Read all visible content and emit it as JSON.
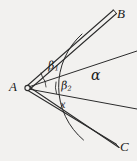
{
  "figure": {
    "kind": "geometry-angle-diagram",
    "background_color": "#f2f1ef",
    "ink_color": "#2b2b2b",
    "points": {
      "vertex_label": "A",
      "upper_ray_label": "B",
      "lower_ray_label": "C"
    },
    "angles": {
      "alpha": "α",
      "beta1_base": "β",
      "beta1_sub": "1",
      "beta2_base": "β",
      "beta2_sub": "2",
      "x": "x"
    },
    "geometry": {
      "vertex": {
        "x": 26,
        "y": 88
      },
      "vertex_dot_radius": 2.6,
      "rays": [
        {
          "name": "ray-AB",
          "style": "double",
          "to_x": 116,
          "to_y": 12
        },
        {
          "name": "ray-upper-interior",
          "style": "single",
          "to_x": 137,
          "to_y": 51
        },
        {
          "name": "ray-lower-interior",
          "style": "single",
          "to_x": 137,
          "to_y": 109
        },
        {
          "name": "ray-AC",
          "style": "double",
          "to_x": 119,
          "to_y": 147
        }
      ],
      "main_arc_radius": 70,
      "beta1_arc_radius": 20,
      "beta2_arc_radius": 20
    }
  }
}
